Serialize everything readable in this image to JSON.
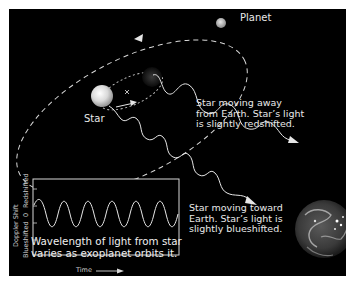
{
  "diagram": {
    "labels": {
      "planet": "Planet",
      "star": "Star",
      "away": "Star moving away\nfrom Earth. Star’s light\nis slightly redshifted.",
      "toward": "Star moving toward\nEarth. Star’s light is\nslightly blueshifted."
    },
    "colors": {
      "background": "#000000",
      "frame": "#ffffff",
      "lines": "#e6e6e6",
      "text": "#e8e8e8"
    }
  },
  "graph": {
    "caption": "Wavelength of light from star\nvaries as exoplanet orbits it.",
    "y_axis": {
      "title": "Doppler Shift",
      "ticks": [
        "Blueshifted",
        "0",
        "Redshifted"
      ]
    },
    "x_axis": {
      "title": "Time"
    },
    "cycles_shown": 5
  }
}
